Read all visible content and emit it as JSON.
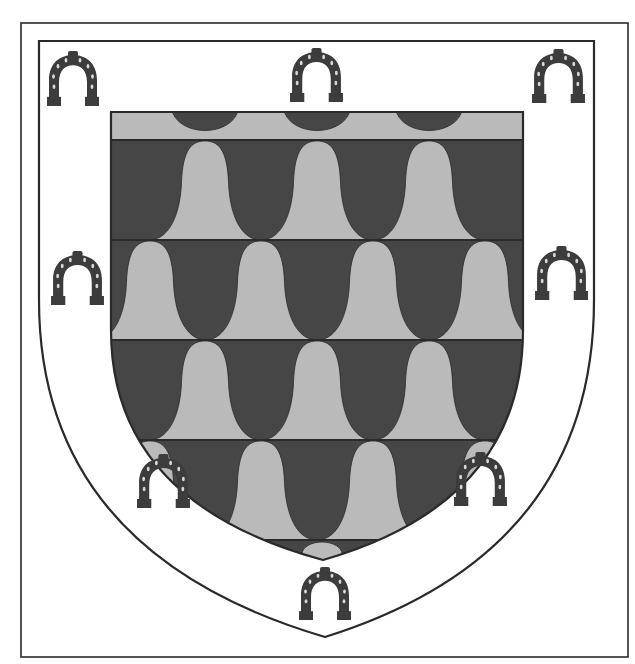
{
  "image": {
    "subject": "heraldic-coat-of-arms",
    "width": 635,
    "height": 664,
    "background": "#ffffff"
  },
  "colors": {
    "light": "#bababa",
    "dark": "#464646",
    "outline": "#2a2a2a",
    "field": "#ffffff",
    "horseshoe": "#3c3c3c",
    "horseshoe_nail": "#d8d8d8"
  },
  "frame": {
    "x": 21,
    "y": 23,
    "width": 607,
    "height": 634
  },
  "shield": {
    "top_y": 41,
    "left_x": 39,
    "right_x": 594,
    "shoulder_y": 300,
    "tip": [
      325,
      637
    ]
  },
  "escutcheon": {
    "top_y": 112,
    "left_x": 111,
    "right_x": 523,
    "shoulder_y": 330,
    "tip": [
      323,
      560
    ],
    "band_lines": [
      140,
      240,
      340,
      440,
      540
    ],
    "pattern": "vair-bells",
    "rows": [
      {
        "top": 112,
        "bottom": 140,
        "type": "chief",
        "dark_domes": [
          205,
          317,
          429
        ]
      },
      {
        "top": 140,
        "bottom": 240,
        "light_bells": [
          205,
          317,
          429
        ],
        "dark_bells": [
          150,
          261,
          373,
          485
        ]
      },
      {
        "top": 240,
        "bottom": 340,
        "light_bells": [
          150,
          261,
          373,
          485
        ],
        "dark_bells": [
          205,
          317,
          429
        ]
      },
      {
        "top": 340,
        "bottom": 440,
        "light_bells": [
          205,
          317,
          429
        ],
        "dark_bells": [
          150,
          261,
          373,
          485
        ]
      },
      {
        "top": 440,
        "bottom": 540,
        "light_bells": [
          150,
          261,
          373,
          485
        ],
        "dark_bells": [
          205,
          317,
          429
        ]
      },
      {
        "top": 540,
        "bottom": 560,
        "type": "base",
        "light_domes": [
          322
        ]
      }
    ],
    "bell_pitch": 112
  },
  "charges": {
    "name": "horseshoe",
    "count": 8,
    "items": [
      {
        "id": "top-left",
        "x": 45,
        "y": 50,
        "w": 56,
        "h": 57
      },
      {
        "id": "top-center",
        "x": 288,
        "y": 47,
        "w": 57,
        "h": 56
      },
      {
        "id": "top-right",
        "x": 530,
        "y": 48,
        "w": 57,
        "h": 56
      },
      {
        "id": "middle-left",
        "x": 49,
        "y": 250,
        "w": 57,
        "h": 56
      },
      {
        "id": "middle-right",
        "x": 533,
        "y": 245,
        "w": 57,
        "h": 56
      },
      {
        "id": "lower-left",
        "x": 135,
        "y": 453,
        "w": 57,
        "h": 56
      },
      {
        "id": "lower-right",
        "x": 452,
        "y": 451,
        "w": 57,
        "h": 56
      },
      {
        "id": "bottom-center",
        "x": 297,
        "y": 566,
        "w": 56,
        "h": 55
      }
    ]
  }
}
